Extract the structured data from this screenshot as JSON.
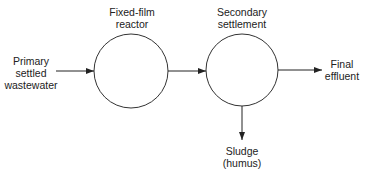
{
  "diagram": {
    "type": "process-flow",
    "nodes": [
      {
        "id": "reactor",
        "label_line1": "Fixed-film",
        "label_line2": "reactor",
        "shape": "circle"
      },
      {
        "id": "settlement",
        "label_line1": "Secondary",
        "label_line2": "settlement",
        "shape": "circle"
      }
    ],
    "inputs": {
      "label_line1": "Primary",
      "label_line2": "settled",
      "label_line3": "wastewater"
    },
    "outputs": {
      "effluent": {
        "label_line1": "Final",
        "label_line2": "effluent"
      },
      "sludge": {
        "label_line1": "Sludge",
        "label_line2": "(humus)"
      }
    },
    "edges": [
      {
        "from": "Primary settled wastewater",
        "to": "Fixed-film reactor"
      },
      {
        "from": "Fixed-film reactor",
        "to": "Secondary settlement"
      },
      {
        "from": "Secondary settlement",
        "to": "Final effluent"
      },
      {
        "from": "Secondary settlement",
        "to": "Sludge (humus)"
      }
    ],
    "colors": {
      "stroke": "#333333",
      "text": "#222222"
    }
  }
}
